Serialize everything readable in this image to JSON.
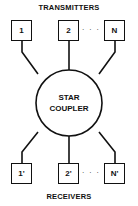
{
  "diagram": {
    "title_top": "TRANSMITTERS",
    "title_bottom": "RECEIVERS",
    "center": {
      "line1": "STAR",
      "line2": "COUPLER"
    },
    "transmitters": [
      "1",
      "2",
      "N"
    ],
    "receivers": [
      "1'",
      "2'",
      "N'"
    ],
    "ellipsis": "· · ·",
    "colors": {
      "stroke": "#111111",
      "background": "#ffffff"
    }
  }
}
